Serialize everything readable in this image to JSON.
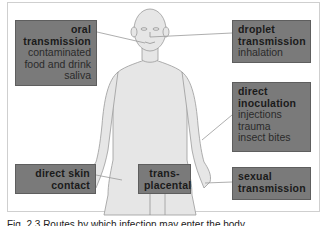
{
  "figure": {
    "caption": "Fig. 2.3 Routes by which infection may enter the body",
    "body_color": "#e6e6e6",
    "box_color": "#7a7a7a"
  },
  "routes": {
    "oral": {
      "title1": "oral",
      "title2": "transmission",
      "details": [
        "contaminated",
        "food and drink",
        "saliva"
      ]
    },
    "droplet": {
      "title1": "droplet",
      "title2": "transmission",
      "details": [
        "inhalation"
      ]
    },
    "inoculation": {
      "title1": "direct",
      "title2": "inoculation",
      "details": [
        "injections",
        "trauma",
        "insect bites"
      ]
    },
    "skin": {
      "title1": "direct skin",
      "title2": "contact"
    },
    "placental": {
      "title1": "trans-",
      "title2": "placental"
    },
    "sexual": {
      "title1": "sexual",
      "title2": "transmission"
    }
  }
}
